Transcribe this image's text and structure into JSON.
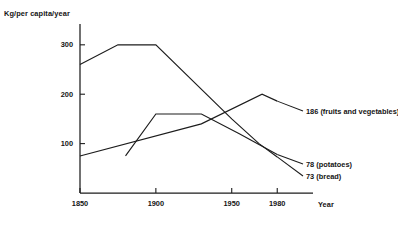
{
  "chart_data": {
    "type": "line",
    "title": "",
    "subtitle": "",
    "xlabel": "Year",
    "ylabel": "Kg/per capita/year",
    "xlim": [
      1850,
      1995
    ],
    "ylim": [
      0,
      330
    ],
    "xticks": [
      "1850",
      "1900",
      "1950",
      "1980"
    ],
    "xtick_values": [
      1850,
      1900,
      1950,
      1980
    ],
    "yticks": [
      "100",
      "200",
      "300"
    ],
    "ytick_values": [
      100,
      200,
      300
    ],
    "grid": false,
    "legend_position": "right-end-of-line labels",
    "line_color": "#1c1c1c",
    "series": [
      {
        "name": "bread",
        "end_label": "73 (bread)",
        "end_value": 73,
        "x": [
          1850,
          1875,
          1900,
          1950,
          1968,
          1980
        ],
        "values": [
          260,
          300,
          300,
          150,
          100,
          73
        ]
      },
      {
        "name": "potatoes",
        "end_label": "78 (potatoes)",
        "end_value": 78,
        "x": [
          1880,
          1900,
          1930,
          1955,
          1980
        ],
        "values": [
          75,
          160,
          160,
          120,
          78
        ]
      },
      {
        "name": "fruits and vegetables",
        "end_label": "186 (fruits and vegetables)",
        "end_value": 186,
        "x": [
          1850,
          1930,
          1970,
          1980
        ],
        "values": [
          75,
          140,
          200,
          186
        ]
      }
    ],
    "annotations": [
      "186 (fruits and vegetables)",
      "78 (potatoes)",
      "73 (bread)"
    ]
  }
}
